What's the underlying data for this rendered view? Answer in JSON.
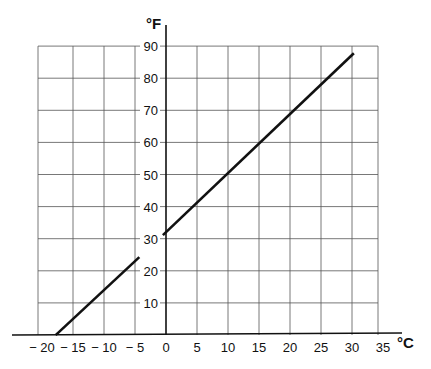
{
  "chart_data": {
    "type": "line",
    "title": "",
    "xlabel": "°C",
    "ylabel": "°F",
    "x_ticks": [
      "− 20",
      "− 15",
      "− 10",
      "− 5",
      "0",
      "5",
      "10",
      "15",
      "20",
      "25",
      "30",
      "35"
    ],
    "x_tick_values": [
      -20,
      -15,
      -10,
      -5,
      0,
      5,
      10,
      15,
      20,
      25,
      30,
      35
    ],
    "y_ticks": [
      "10",
      "20",
      "30",
      "40",
      "50",
      "60",
      "70",
      "80",
      "90"
    ],
    "y_tick_values": [
      10,
      20,
      30,
      40,
      50,
      60,
      70,
      80,
      90
    ],
    "xlim": [
      -20,
      35
    ],
    "ylim": [
      0,
      90
    ],
    "grid": true,
    "legend": null,
    "series": [
      {
        "name": "Fahrenheit vs Celsius",
        "formula": "F = 1.8 × C + 32",
        "x": [
          -17.8,
          0,
          10,
          20,
          30
        ],
        "y": [
          0,
          32,
          50,
          68,
          86
        ]
      }
    ]
  },
  "labels": {
    "y_unit": "°F",
    "x_unit": "°C"
  }
}
